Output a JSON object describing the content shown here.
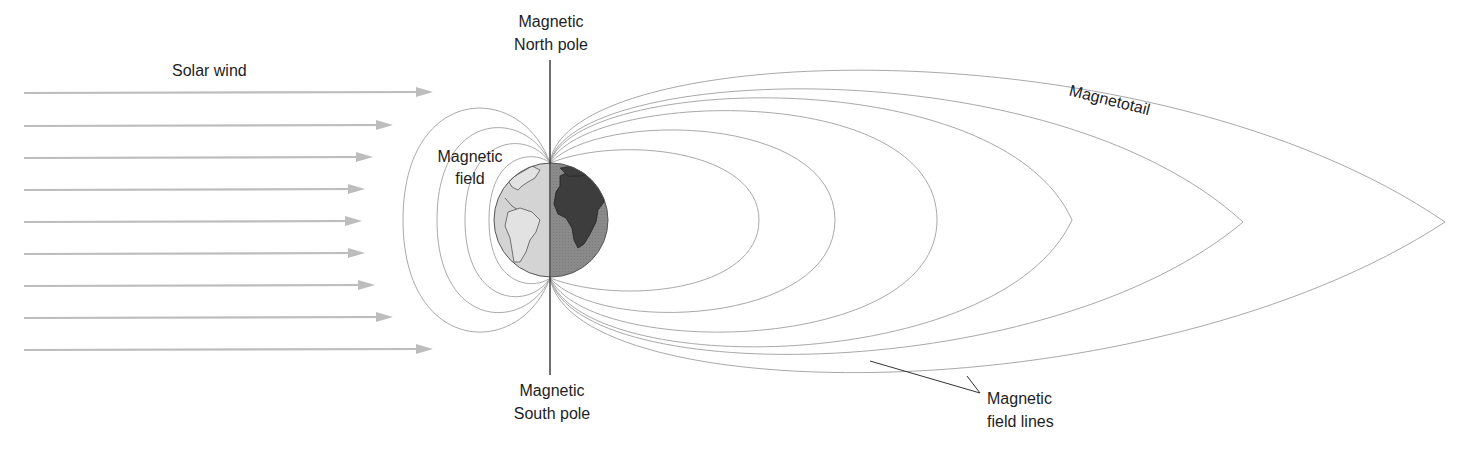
{
  "diagram": {
    "labels": {
      "solar_wind": "Solar wind",
      "north_pole_line1": "Magnetic",
      "north_pole_line2": "North pole",
      "south_pole_line1": "Magnetic",
      "south_pole_line2": "South pole",
      "magnetic_field_line1": "Magnetic",
      "magnetic_field_line2": "field",
      "magnetotail": "Magnetotail",
      "field_lines_line1": "Magnetic",
      "field_lines_line2": "field lines"
    },
    "solar_wind_arrows": 9,
    "dayside_field_loops": 4,
    "nightside_field_loops": 6,
    "colors": {
      "field_line": "#a9a9a9",
      "wind_arrow": "#bdbdbd",
      "axis": "#333333",
      "earth_day": "#d4d4d4",
      "earth_night": "#8a8a8a",
      "continent_day": "#e2e2e2",
      "continent_night": "#3d3d3d",
      "text": "#1e1e1e"
    }
  }
}
